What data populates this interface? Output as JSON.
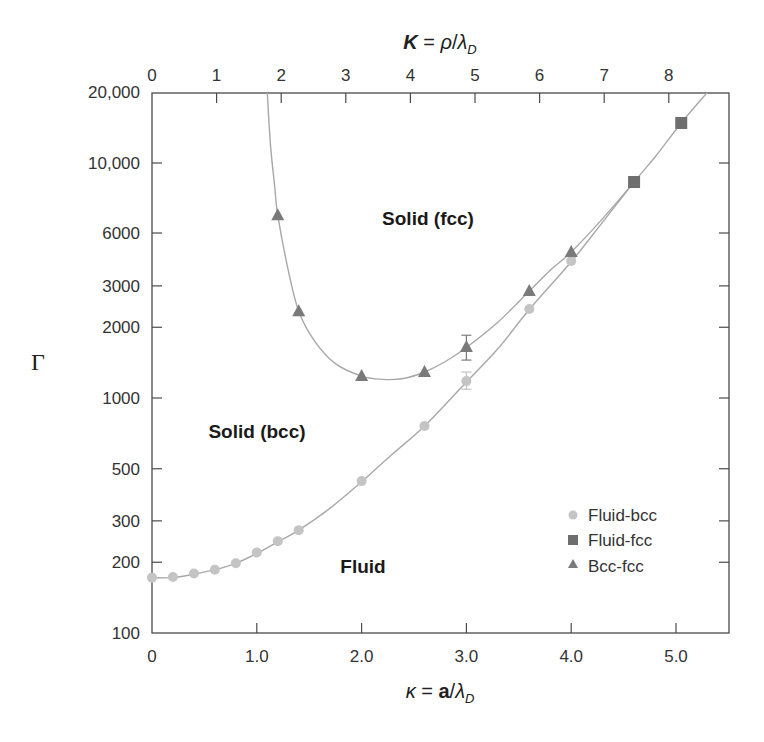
{
  "chart_data": {
    "type": "scatter",
    "title": "",
    "xlabel": "κ = a/λ_D",
    "xlabel_parts": {
      "var": "κ",
      "eq": " = ",
      "num": "a",
      "slash": "/",
      "lambda": "λ",
      "sub": "D"
    },
    "x2label": "K = ρ/λ_D",
    "x2label_parts": {
      "var": "K",
      "eq": " = ",
      "num": "ρ",
      "slash": "/",
      "lambda": "λ",
      "sub": "D"
    },
    "ylabel": "Γ",
    "xlim": [
      0,
      5.5
    ],
    "ylim": [
      100,
      20000
    ],
    "yscale": "log",
    "grid": false,
    "legend_position": "lower right",
    "x_ticks": [
      {
        "value": 0,
        "label": "0"
      },
      {
        "value": 1,
        "label": "1.0"
      },
      {
        "value": 2,
        "label": "2.0"
      },
      {
        "value": 3,
        "label": "3.0"
      },
      {
        "value": 4,
        "label": "4.0"
      },
      {
        "value": 5,
        "label": "5.0"
      }
    ],
    "x2_ticks": [
      {
        "value": 0,
        "label": "0"
      },
      {
        "value": 1,
        "label": "1"
      },
      {
        "value": 2,
        "label": "2"
      },
      {
        "value": 3,
        "label": "3"
      },
      {
        "value": 4,
        "label": "4"
      },
      {
        "value": 5,
        "label": "5"
      },
      {
        "value": 6,
        "label": "6"
      },
      {
        "value": 7,
        "label": "7"
      },
      {
        "value": 8,
        "label": "8"
      }
    ],
    "y_ticks": [
      {
        "value": 20000,
        "label": "20,000"
      },
      {
        "value": 10000,
        "label": "10,000"
      },
      {
        "value": 6000,
        "label": "6000",
        "px": 233
      },
      {
        "value": 3000,
        "label": "3000"
      },
      {
        "value": 2000,
        "label": "2000"
      },
      {
        "value": 1000,
        "label": "1000"
      },
      {
        "value": 500,
        "label": "500"
      },
      {
        "value": 300,
        "label": "300"
      },
      {
        "value": 200,
        "label": "200"
      },
      {
        "value": 100,
        "label": "100"
      }
    ],
    "series": [
      {
        "name": "Fluid-bcc",
        "marker": "circle",
        "color": "#c4c4c4",
        "points": [
          {
            "x": 0.0,
            "y": 172
          },
          {
            "x": 0.2,
            "y": 173
          },
          {
            "x": 0.4,
            "y": 179
          },
          {
            "x": 0.6,
            "y": 186
          },
          {
            "x": 0.8,
            "y": 198
          },
          {
            "x": 1.0,
            "y": 220
          },
          {
            "x": 1.2,
            "y": 246
          },
          {
            "x": 1.4,
            "y": 274
          },
          {
            "x": 2.0,
            "y": 443
          },
          {
            "x": 2.6,
            "y": 760
          },
          {
            "x": 3.0,
            "y": 1180,
            "err": [
              1090,
              1290
            ]
          },
          {
            "x": 3.6,
            "y": 2390
          },
          {
            "x": 4.0,
            "y": 3830
          }
        ]
      },
      {
        "name": "Fluid-fcc",
        "marker": "square",
        "color": "#6e6e6e",
        "points": [
          {
            "x": 4.6,
            "y": 8300
          },
          {
            "x": 5.05,
            "y": 14800
          }
        ]
      },
      {
        "name": "Bcc-fcc",
        "marker": "triangle",
        "color": "#7a7a7a",
        "points": [
          {
            "x": 1.2,
            "y": 6000
          },
          {
            "x": 1.4,
            "y": 2340
          },
          {
            "x": 2.0,
            "y": 1240
          },
          {
            "x": 2.6,
            "y": 1290
          },
          {
            "x": 3.0,
            "y": 1650,
            "err": [
              1450,
              1850
            ]
          },
          {
            "x": 3.6,
            "y": 2850
          },
          {
            "x": 4.0,
            "y": 4180
          }
        ]
      }
    ],
    "curves": [
      {
        "name": "fluid-solid-boundary",
        "color": "#a8a8a8",
        "points": [
          [
            0,
            172
          ],
          [
            0.2,
            172
          ],
          [
            0.4,
            178
          ],
          [
            0.6,
            186
          ],
          [
            0.8,
            198
          ],
          [
            1.0,
            218
          ],
          [
            1.2,
            244
          ],
          [
            1.4,
            274
          ],
          [
            1.7,
            340
          ],
          [
            2.0,
            440
          ],
          [
            2.3,
            580
          ],
          [
            2.6,
            760
          ],
          [
            3.0,
            1170
          ],
          [
            3.3,
            1620
          ],
          [
            3.6,
            2380
          ],
          [
            4.0,
            3800
          ],
          [
            4.3,
            5600
          ],
          [
            4.6,
            8300
          ],
          [
            4.8,
            10600
          ],
          [
            5.05,
            14800
          ],
          [
            5.3,
            20000
          ]
        ]
      },
      {
        "name": "bcc-fcc-boundary",
        "color": "#a8a8a8",
        "points": [
          [
            1.1,
            20000
          ],
          [
            1.13,
            12000
          ],
          [
            1.17,
            8000
          ],
          [
            1.2,
            6000
          ],
          [
            1.3,
            3500
          ],
          [
            1.4,
            2340
          ],
          [
            1.55,
            1750
          ],
          [
            1.75,
            1400
          ],
          [
            2.0,
            1240
          ],
          [
            2.2,
            1200
          ],
          [
            2.4,
            1210
          ],
          [
            2.6,
            1290
          ],
          [
            2.8,
            1430
          ],
          [
            3.0,
            1640
          ],
          [
            3.3,
            2100
          ],
          [
            3.6,
            2850
          ],
          [
            3.8,
            3500
          ],
          [
            4.0,
            4180
          ],
          [
            4.3,
            5800
          ],
          [
            4.6,
            8300
          ]
        ]
      }
    ],
    "annotations": [
      {
        "text": "Solid (fcc)",
        "x": 3.1,
        "y": 7200
      },
      {
        "text": "Solid (bcc)",
        "x": 0.5,
        "y": 830
      },
      {
        "text": "Fluid",
        "x": 1.75,
        "y": 185
      }
    ]
  },
  "legend": {
    "items": [
      {
        "label": "Fluid-bcc",
        "marker": "circle"
      },
      {
        "label": "Fluid-fcc",
        "marker": "square"
      },
      {
        "label": "Bcc-fcc",
        "marker": "triangle"
      }
    ]
  },
  "labels": {
    "region_fcc": "Solid (fcc)",
    "region_bcc": "Solid (bcc)",
    "region_fluid": "Fluid",
    "gamma": "Γ"
  },
  "colors": {
    "axis": "#4a4a4a",
    "curve": "#a8a8a8",
    "circle": "#c4c4c4",
    "square": "#6e6e6e",
    "triangle": "#7a7a7a"
  }
}
